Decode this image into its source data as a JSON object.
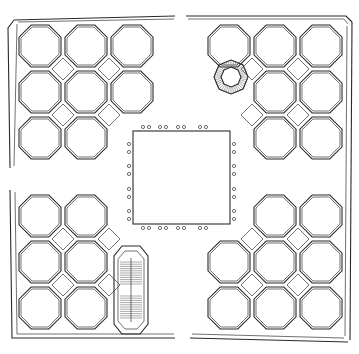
{
  "drawing": {
    "type": "architectural floor plan",
    "background": "#ffffff",
    "line_color": "#2a2a2a",
    "outer_boundary": {
      "x": 8,
      "y": 14,
      "width": 344,
      "height": 331
    },
    "courtyard": {
      "x": 133,
      "y": 131,
      "width": 97,
      "height": 93,
      "columns_per_side": 8
    },
    "octagon_pitch": 46,
    "quadrants": [
      {
        "name": "north-west",
        "rooms": 8
      },
      {
        "name": "north-east",
        "rooms": 8,
        "feature": "spiral-stair"
      },
      {
        "name": "south-west",
        "rooms": 6,
        "feature": "oval-double-stair"
      },
      {
        "name": "south-east",
        "rooms": 8
      }
    ]
  }
}
